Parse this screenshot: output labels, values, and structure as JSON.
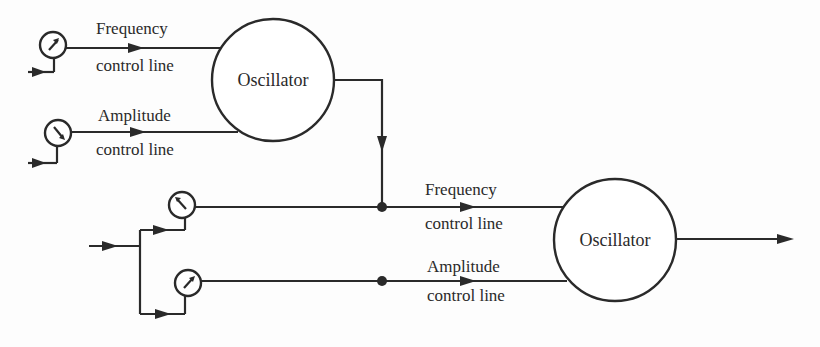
{
  "diagram": {
    "top_stage": {
      "oscillator": {
        "label": "Oscillator"
      },
      "frequency_line": {
        "label_line1": "Frequency",
        "label_line2": "control line"
      },
      "amplitude_line": {
        "label_line1": "Amplitude",
        "label_line2": "control line"
      },
      "frequency_knob": {
        "icon": "potentiometer-icon",
        "pointer": "up-right"
      },
      "amplitude_knob": {
        "icon": "potentiometer-icon",
        "pointer": "down-right"
      }
    },
    "bottom_stage": {
      "oscillator": {
        "label": "Oscillator"
      },
      "frequency_line": {
        "label_line1": "Frequency",
        "label_line2": "control line"
      },
      "amplitude_line": {
        "label_line1": "Amplitude",
        "label_line2": "control line"
      },
      "frequency_knob": {
        "icon": "potentiometer-icon",
        "pointer": "up-left"
      },
      "amplitude_knob": {
        "icon": "potentiometer-icon",
        "pointer": "up-right"
      }
    },
    "colors": {
      "ink": "#2a2a2a",
      "paper": "#fdfdfd"
    }
  }
}
